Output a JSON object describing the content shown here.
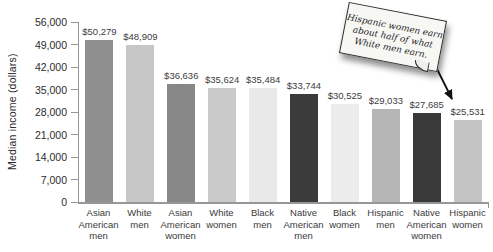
{
  "chart_data": {
    "type": "bar",
    "title": "",
    "xlabel": "",
    "ylabel": "Median income (dollars)",
    "ylim": [
      0,
      56000
    ],
    "grid": false,
    "legend": false,
    "yticks": [
      0,
      7000,
      14000,
      21000,
      28000,
      35000,
      42000,
      49000,
      56000
    ],
    "ytick_labels": [
      "0",
      "7,000",
      "14,000",
      "21,000",
      "28,000",
      "35,000",
      "42,000",
      "49,000",
      "56,000"
    ],
    "categories": [
      "Asian American men",
      "White men",
      "Asian American women",
      "White women",
      "Black men",
      "Native American men",
      "Black women",
      "Hispanic men",
      "Native American women",
      "Hispanic women"
    ],
    "values": [
      50279,
      48909,
      36636,
      35624,
      35484,
      33744,
      30525,
      29033,
      27685,
      25531
    ],
    "value_labels": [
      "$50,279",
      "$48,909",
      "$36,636",
      "$35,624",
      "$35,484",
      "$33,744",
      "$30,525",
      "$29,033",
      "$27,685",
      "$25,531"
    ],
    "bar_colors": [
      "#8f8f8f",
      "#c7c7c7",
      "#878787",
      "#cacaca",
      "#e9e9e9",
      "#3b3b3b",
      "#ececec",
      "#b6b6b6",
      "#393939",
      "#c4c4c4"
    ]
  },
  "annotation": {
    "text": "Hispanic women earn about half of what White men earn.",
    "lines": [
      "Hispanic women earn",
      "about half of what",
      "White men earn."
    ],
    "arrow_color": "#111111"
  }
}
